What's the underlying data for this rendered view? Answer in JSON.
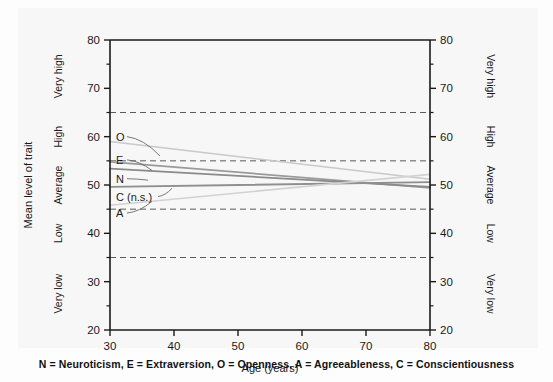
{
  "chart_data": {
    "type": "line",
    "title": "",
    "subtitle": "",
    "xlabel": "Age (years)",
    "ylabel": "Mean level of trait",
    "xlim": [
      30,
      80
    ],
    "ylim": [
      20,
      80
    ],
    "xticks": [
      30,
      40,
      50,
      60,
      70,
      80
    ],
    "yticks": [
      20,
      30,
      40,
      50,
      60,
      70,
      80
    ],
    "xtick_labels": [
      "30",
      "40",
      "50",
      "60",
      "70",
      "80"
    ],
    "ytick_labels": [
      "20",
      "30",
      "40",
      "50",
      "60",
      "70",
      "80"
    ],
    "y_minor_tick_step": 5,
    "grid": false,
    "legend_position": "inline-labels-left",
    "reference_lines": {
      "style": "dashed",
      "values": [
        35,
        45,
        55,
        65
      ],
      "color": "#5a5a5a"
    },
    "category_bands": [
      {
        "label": "Very low",
        "range": [
          20,
          35
        ],
        "center": 27.5
      },
      {
        "label": "Low",
        "range": [
          35,
          45
        ],
        "center": 40
      },
      {
        "label": "Average",
        "range": [
          45,
          55
        ],
        "center": 50
      },
      {
        "label": "High",
        "range": [
          55,
          65
        ],
        "center": 60
      },
      {
        "label": "Very high",
        "range": [
          65,
          80
        ],
        "center": 72.5
      }
    ],
    "left_axis_category_labels": [
      "Very low",
      "Low",
      "Average",
      "High",
      "Very high"
    ],
    "right_axis_category_labels": [
      "Very low",
      "Low",
      "Average",
      "High",
      "Very high"
    ],
    "x": [
      30,
      80
    ],
    "series": [
      {
        "name": "O",
        "full_name": "Openness",
        "label": "O",
        "values": [
          59.0,
          51.2
        ],
        "color": "#c9c9c9",
        "width": 1.6,
        "significant": true
      },
      {
        "name": "E",
        "full_name": "Extraversion",
        "label": "E",
        "values": [
          54.8,
          49.4
        ],
        "color": "#9a9a9a",
        "width": 1.8,
        "significant": true
      },
      {
        "name": "N",
        "full_name": "Neuroticism",
        "label": "N",
        "values": [
          53.4,
          49.6
        ],
        "color": "#8a8a8a",
        "width": 1.8,
        "significant": true
      },
      {
        "name": "C",
        "full_name": "Conscientiousness",
        "label": "C (n.s.)",
        "values": [
          49.6,
          50.6
        ],
        "color": "#8f8f8f",
        "width": 1.8,
        "significant": false
      },
      {
        "name": "A",
        "full_name": "Agreeableness",
        "label": "A",
        "values": [
          45.8,
          52.2
        ],
        "color": "#d2d2d2",
        "width": 1.6,
        "significant": true
      }
    ],
    "annotations": [
      {
        "text": "O",
        "x": 30,
        "y": 60.0
      },
      {
        "text": "E",
        "x": 30,
        "y": 55.2
      },
      {
        "text": "N",
        "x": 30,
        "y": 51.3
      },
      {
        "text": "C (n.s.)",
        "x": 30,
        "y": 47.6
      },
      {
        "text": "A",
        "x": 30,
        "y": 44.2
      }
    ]
  },
  "caption": "N = Neuroticism, E = Extraversion, O = Openness, A = Agreeableness, C = Conscientiousness",
  "colors": {
    "axis": "#1a1a1a",
    "panel_background": "#f7f7f7",
    "figure_background": "#fdfdfd",
    "text": "#1a1a1a",
    "reference_line": "#5a5a5a"
  }
}
